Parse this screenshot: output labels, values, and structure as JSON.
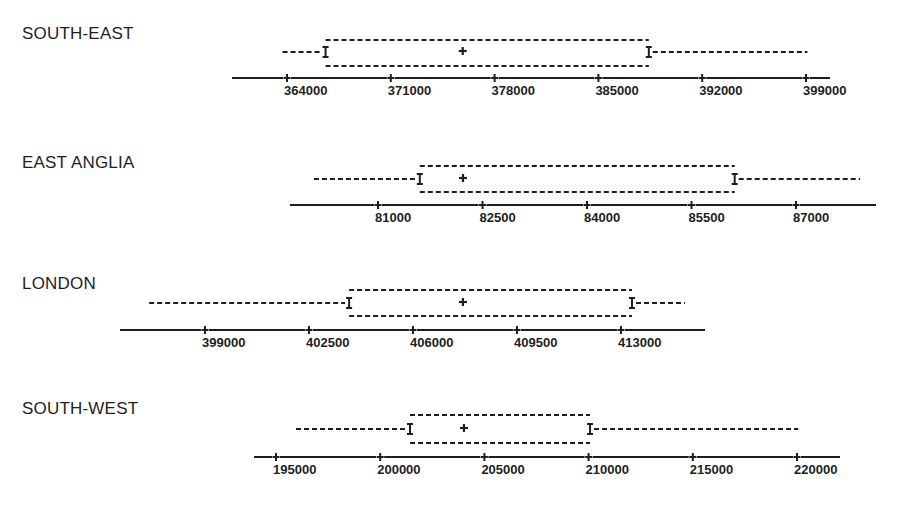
{
  "chart_data": [
    {
      "type": "boxplot",
      "title": "SOUTH-EAST",
      "ticks": [
        364000,
        371000,
        378000,
        385000,
        392000,
        399000
      ],
      "tick_labels": [
        "364000",
        "371000",
        "378000",
        "385000",
        "392000",
        "399000"
      ],
      "axis_range": [
        363300,
        402200
      ],
      "whisker_low": 363700,
      "box_low": 366600,
      "center": 375850,
      "box_high": 388400,
      "whisker_high": 399100
    },
    {
      "type": "boxplot",
      "title": "EAST ANGLIA",
      "ticks": [
        81000,
        82500,
        84000,
        85500,
        87000
      ],
      "tick_labels": [
        "81000",
        "82500",
        "84000",
        "85500",
        "87000"
      ],
      "axis_range": [
        79740,
        88150
      ],
      "whisker_low": 80080,
      "box_low": 81600,
      "center": 82220,
      "box_high": 86120,
      "whisker_high": 87920
    },
    {
      "type": "boxplot",
      "title": "LONDON",
      "ticks": [
        399000,
        402500,
        406000,
        409500,
        413000
      ],
      "tick_labels": [
        "399000",
        "402500",
        "406000",
        "409500",
        "413000"
      ],
      "axis_range": [
        396140,
        415830
      ],
      "whisker_low": 397120,
      "box_low": 403850,
      "center": 407680,
      "box_high": 413370,
      "whisker_high": 415150
    },
    {
      "type": "boxplot",
      "title": "SOUTH-WEST",
      "ticks": [
        195000,
        200000,
        205000,
        210000,
        215000,
        220000
      ],
      "tick_labels": [
        "195000",
        "200000",
        "205000",
        "210000",
        "215000",
        "220000"
      ],
      "axis_range": [
        193940,
        222080
      ],
      "whisker_low": 195960,
      "box_low": 201430,
      "center": 204020,
      "box_high": 210070,
      "whisker_high": 220060
    }
  ],
  "layout": [
    {
      "title_x": 22,
      "title_y": 24,
      "axis_y": 78,
      "axis_x0": 232,
      "axis_x1": 830,
      "tick_px0": 287,
      "tick_px1": 806,
      "box_top": 40,
      "box_bottom": 66,
      "whisker_y": 52
    },
    {
      "title_x": 22,
      "title_y": 153,
      "axis_y": 205,
      "axis_x0": 290,
      "axis_x1": 876,
      "tick_px0": 378,
      "tick_px1": 796,
      "box_top": 166,
      "box_bottom": 192,
      "whisker_y": 179
    },
    {
      "title_x": 22,
      "title_y": 274,
      "axis_y": 330,
      "axis_x0": 120,
      "axis_x1": 705,
      "tick_px0": 205,
      "tick_px1": 621,
      "box_top": 290,
      "box_bottom": 316,
      "whisker_y": 303
    },
    {
      "title_x": 22,
      "title_y": 399,
      "axis_y": 457,
      "axis_x0": 254,
      "axis_x1": 840,
      "tick_px0": 276,
      "tick_px1": 797,
      "box_top": 415,
      "box_bottom": 443,
      "whisker_y": 429
    }
  ],
  "colors": {
    "ink": "#1e1e1e",
    "background": "#ffffff"
  }
}
